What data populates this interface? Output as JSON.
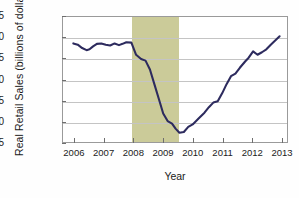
{
  "chart_data": {
    "type": "line",
    "title": "",
    "xlabel": "Year",
    "ylabel": "Real Retail Sales (billions of dollars)",
    "xlim": [
      2005.6,
      2013.2
    ],
    "ylim": [
      155,
      185
    ],
    "yticks": [
      155,
      160,
      165,
      170,
      175,
      180,
      185
    ],
    "xticks": [
      2006,
      2007,
      2008,
      2009,
      2010,
      2011,
      2012,
      2013
    ],
    "grid": true,
    "legend": false,
    "line_color": "#2d2b5e",
    "band_color": "#cbcb99",
    "shaded_regions": [
      {
        "label": "recession",
        "start": 2007.92,
        "end": 2009.5
      }
    ],
    "series": [
      {
        "name": "Real Retail Sales",
        "x": [
          2005.95,
          2006.1,
          2006.25,
          2006.4,
          2006.5,
          2006.62,
          2006.75,
          2006.9,
          2007.05,
          2007.2,
          2007.35,
          2007.5,
          2007.62,
          2007.75,
          2007.92,
          2008.08,
          2008.25,
          2008.4,
          2008.55,
          2008.7,
          2008.85,
          2009.0,
          2009.15,
          2009.3,
          2009.42,
          2009.55,
          2009.7,
          2009.85,
          2010.0,
          2010.2,
          2010.4,
          2010.55,
          2010.7,
          2010.85,
          2011.0,
          2011.15,
          2011.3,
          2011.45,
          2011.6,
          2011.78,
          2011.9,
          2012.05,
          2012.2,
          2012.35,
          2012.5,
          2012.65,
          2012.8,
          2012.95
        ],
        "y": [
          178.7,
          178.4,
          177.6,
          177.1,
          177.3,
          178.0,
          178.6,
          178.7,
          178.4,
          178.2,
          178.7,
          178.3,
          178.6,
          179.0,
          178.9,
          176.0,
          175.0,
          174.6,
          172.5,
          169.0,
          165.5,
          162.0,
          160.2,
          159.6,
          158.4,
          157.4,
          157.6,
          158.8,
          159.4,
          160.8,
          162.2,
          163.5,
          164.6,
          164.9,
          166.8,
          169.0,
          170.9,
          171.5,
          172.9,
          174.4,
          175.3,
          176.8,
          176.0,
          176.6,
          177.3,
          178.4,
          179.4,
          180.4
        ]
      }
    ]
  }
}
